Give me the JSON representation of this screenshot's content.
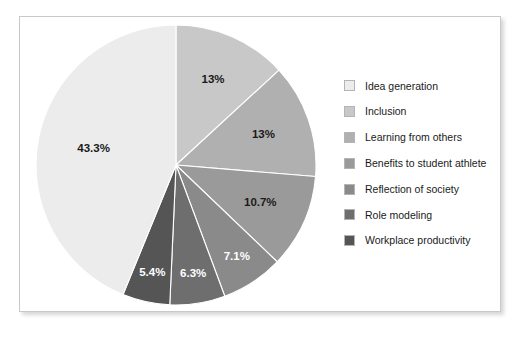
{
  "chart_data": {
    "type": "pie",
    "title": "",
    "legend_position": "right",
    "start_angle_deg": 0,
    "direction": "clockwise",
    "categories": [
      "Idea generation",
      "Inclusion",
      "Learning from others",
      "Benefits to student athlete",
      "Reflection of society",
      "Role modeling",
      "Workplace productivity"
    ],
    "values": [
      43.3,
      13,
      13,
      10.7,
      7.1,
      6.3,
      5.4
    ],
    "labels": [
      "43.3%",
      "13%",
      "13%",
      "10.7%",
      "7.1%",
      "6.3%",
      "5.4%"
    ],
    "colors": [
      "#ececec",
      "#c8c8c8",
      "#b0b0b0",
      "#9a9a9a",
      "#8a8a8a",
      "#6e6e6e",
      "#555555"
    ],
    "label_text_colors": [
      "#1a1a1a",
      "#1a1a1a",
      "#1a1a1a",
      "#1a1a1a",
      "#ffffff",
      "#ffffff",
      "#ffffff"
    ],
    "slices": [
      {
        "name": "Inclusion",
        "label": "13%",
        "value": 13,
        "color": "#c8c8c8",
        "label_color": "#1a1a1a"
      },
      {
        "name": "Learning from others",
        "label": "13%",
        "value": 13,
        "color": "#b0b0b0",
        "label_color": "#1a1a1a"
      },
      {
        "name": "Benefits to student athlete",
        "label": "10.7%",
        "value": 10.7,
        "color": "#9a9a9a",
        "label_color": "#1a1a1a"
      },
      {
        "name": "Reflection of society",
        "label": "7.1%",
        "value": 7.1,
        "color": "#8a8a8a",
        "label_color": "#ffffff"
      },
      {
        "name": "Role modeling",
        "label": "6.3%",
        "value": 6.3,
        "color": "#6e6e6e",
        "label_color": "#ffffff"
      },
      {
        "name": "Workplace productivity",
        "label": "5.4%",
        "value": 5.4,
        "color": "#555555",
        "label_color": "#ffffff"
      },
      {
        "name": "Idea generation",
        "label": "43.3%",
        "value": 43.3,
        "color": "#ececec",
        "label_color": "#1a1a1a"
      }
    ]
  },
  "legend": {
    "items": [
      {
        "label": "Idea generation",
        "color": "#ececec"
      },
      {
        "label": "Inclusion",
        "color": "#c8c8c8"
      },
      {
        "label": "Learning from others",
        "color": "#b0b0b0"
      },
      {
        "label": "Benefits to student athlete",
        "color": "#9a9a9a"
      },
      {
        "label": "Reflection of society",
        "color": "#8a8a8a"
      },
      {
        "label": "Role modeling",
        "color": "#6e6e6e"
      },
      {
        "label": "Workplace productivity",
        "color": "#555555"
      }
    ]
  }
}
